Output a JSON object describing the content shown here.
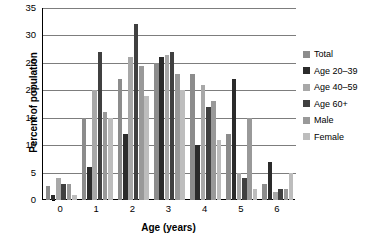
{
  "chart_data": {
    "type": "bar",
    "title": "",
    "xlabel": "Age (years)",
    "ylabel": "Percent of population",
    "categories": [
      "0",
      "1",
      "2",
      "3",
      "4",
      "5",
      "6"
    ],
    "ylim": [
      0,
      35
    ],
    "ytick_labels": [
      "0",
      "5",
      "10",
      "15",
      "20",
      "25",
      "30",
      "35"
    ],
    "ytick_values": [
      0,
      5,
      10,
      15,
      20,
      25,
      30,
      35
    ],
    "grid": true,
    "legend_position": "right",
    "series": [
      {
        "name": "Total",
        "color": "#8c8c8c",
        "values": [
          2.5,
          15,
          22,
          25,
          23,
          12,
          3
        ]
      },
      {
        "name": "Age 20–39",
        "color": "#2b2b2b",
        "values": [
          1,
          6,
          12,
          26,
          10,
          22,
          7
        ]
      },
      {
        "name": "Age 40–59",
        "color": "#a8a8a8",
        "values": [
          4,
          20,
          26,
          26.5,
          21,
          5,
          1.5
        ]
      },
      {
        "name": "Age 60+",
        "color": "#404040",
        "values": [
          3,
          27,
          32,
          27,
          17,
          4,
          2
        ]
      },
      {
        "name": "Male",
        "color": "#999999",
        "values": [
          3,
          16,
          24.5,
          23,
          18,
          15,
          2
        ]
      },
      {
        "name": "Female",
        "color": "#bdbdbd",
        "values": [
          1,
          15,
          19,
          20,
          11,
          2,
          5
        ]
      }
    ]
  },
  "legend": {
    "items": [
      {
        "label": "Total"
      },
      {
        "label": "Age 20–39"
      },
      {
        "label": "Age 40–59"
      },
      {
        "label": "Age 60+"
      },
      {
        "label": "Male"
      },
      {
        "label": "Female"
      }
    ]
  }
}
